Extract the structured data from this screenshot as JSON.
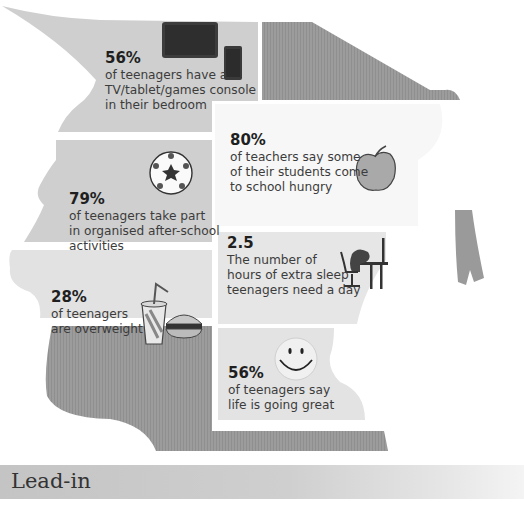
{
  "infographic": {
    "theme_colors": {
      "dark_panel": "#9a9a9a",
      "mid_panel": "#cfcfcf",
      "light_panel": "#ececec",
      "text": "#3c3c3c",
      "heading": "#1f1f1f"
    },
    "stats": [
      {
        "id": "devices",
        "value": "56%",
        "description": "of teenagers have a\nTV/tablet/games console\nin their bedroom",
        "icon": "tablet-phone-icon"
      },
      {
        "id": "hungry",
        "value": "80%",
        "description": "of teachers say some\nof their students come\nto school hungry",
        "icon": "apple-icon"
      },
      {
        "id": "afterschool",
        "value": "79%",
        "description": "of teenagers take part\nin organised after-school\nactivities",
        "icon": "football-icon"
      },
      {
        "id": "sleep",
        "value": "2.5",
        "description": "The number of\nhours of extra sleep\nteenagers need a day",
        "icon": "sleeping-at-desk-icon"
      },
      {
        "id": "overweight",
        "value": "28%",
        "description": "of teenagers\nare overweight",
        "icon": "fast-food-icon"
      },
      {
        "id": "happy",
        "value": "56%",
        "description": "of teenagers say\nlife is going great",
        "icon": "smiley-face-icon"
      }
    ]
  },
  "section": {
    "title": "Lead-in"
  }
}
